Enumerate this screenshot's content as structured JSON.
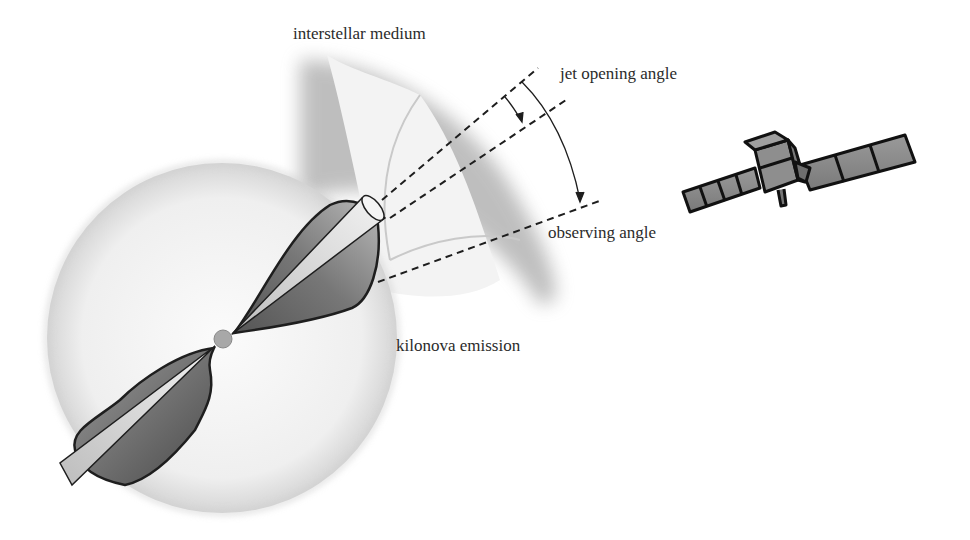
{
  "diagram": {
    "type": "schematic illustration",
    "labels": {
      "interstellar_medium": "interstellar medium",
      "jet_opening_angle": "jet opening angle",
      "observing_angle": "observing angle",
      "kilonova_emission": "kilonova emission"
    },
    "elements": [
      {
        "name": "kilonova-sphere",
        "description": "large translucent grey sphere"
      },
      {
        "name": "merger-core",
        "description": "small central grey sphere"
      },
      {
        "name": "upper-outflow-lobe",
        "description": "dark grey lobe toward upper right"
      },
      {
        "name": "lower-outflow-lobe",
        "description": "dark grey lobe toward lower left"
      },
      {
        "name": "upper-jet-cone",
        "description": "narrow light cone ending in open cylinder"
      },
      {
        "name": "lower-jet-cone",
        "description": "narrow light cone ending in open cylinder"
      },
      {
        "name": "interstellar-medium-shell",
        "description": "curved shaded shell around upper jet"
      },
      {
        "name": "jet-edge-lines",
        "description": "two dashed lines bounding jet"
      },
      {
        "name": "observer-line",
        "description": "dashed line of sight to observer"
      },
      {
        "name": "satellite",
        "description": "observing satellite with two solar panels"
      }
    ],
    "colors": {
      "sphere": "#e9e9e9",
      "lobe": "#6d6d6d",
      "outline": "#1e1e1e",
      "shell": "#bdbdbd",
      "text": "#2b2b2b"
    }
  }
}
